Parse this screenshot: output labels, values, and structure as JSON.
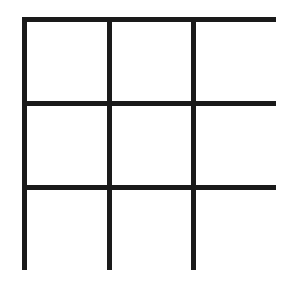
{
  "board": {
    "rows": 3,
    "cols": 3,
    "line_color": "#1a1a1a",
    "background": "#ffffff",
    "cells": [
      "",
      "",
      "",
      "",
      "",
      "",
      "",
      "",
      ""
    ]
  }
}
